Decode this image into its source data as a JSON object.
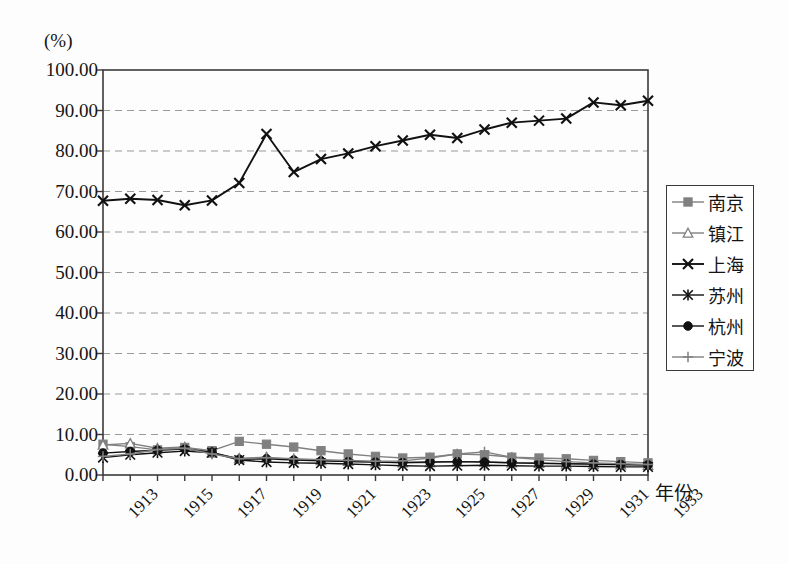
{
  "axis": {
    "unit_label": "(%)",
    "x_title": "年份",
    "y_ticks": [
      "100.00",
      "90.00",
      "80.00",
      "70.00",
      "60.00",
      "50.00",
      "40.00",
      "30.00",
      "20.00",
      "10.00",
      "0.00"
    ],
    "x_ticks": [
      "1913",
      "1915",
      "1917",
      "1919",
      "1921",
      "1923",
      "1925",
      "1927",
      "1929",
      "1931",
      "1933"
    ]
  },
  "legend": {
    "items": [
      {
        "label": "南京",
        "marker": "square"
      },
      {
        "label": "镇江",
        "marker": "triangle"
      },
      {
        "label": "上海",
        "marker": "cross"
      },
      {
        "label": "苏州",
        "marker": "asterisk"
      },
      {
        "label": "杭州",
        "marker": "circle"
      },
      {
        "label": "宁波",
        "marker": "plus"
      }
    ]
  },
  "colors": {
    "line_dark": "#111111",
    "line_gray": "#808080",
    "grid": "#9a9a9a",
    "frame": "#3a3a3a",
    "background": "#fdfdfd"
  },
  "chart_data": {
    "type": "line",
    "title": "",
    "xlabel": "年份",
    "ylabel": "(%)",
    "xlim": [
      1913,
      1933
    ],
    "ylim": [
      0,
      100
    ],
    "ytick_step": 10,
    "grid": true,
    "grid_style": "dashed-horizontal",
    "legend_position": "right",
    "x": [
      1913,
      1914,
      1915,
      1916,
      1917,
      1918,
      1919,
      1920,
      1921,
      1922,
      1923,
      1924,
      1925,
      1926,
      1927,
      1928,
      1929,
      1930,
      1931,
      1932,
      1933
    ],
    "series": [
      {
        "name": "南京",
        "marker": "square",
        "color": "#808080",
        "values": [
          7.6,
          7.0,
          6.2,
          6.8,
          6.0,
          8.3,
          7.6,
          6.9,
          6.0,
          5.2,
          4.6,
          4.2,
          4.4,
          5.2,
          5.0,
          4.4,
          4.2,
          4.0,
          3.6,
          3.3,
          3.0
        ]
      },
      {
        "name": "镇江",
        "marker": "triangle",
        "color": "#808080",
        "values": [
          7.4,
          7.8,
          6.6,
          6.9,
          5.4,
          4.1,
          4.4,
          3.8,
          3.6,
          3.4,
          3.2,
          3.0,
          3.1,
          3.3,
          3.2,
          3.0,
          2.9,
          2.7,
          2.6,
          2.5,
          2.4
        ]
      },
      {
        "name": "上海",
        "marker": "cross",
        "color": "#111111",
        "values": [
          67.7,
          68.2,
          67.9,
          66.6,
          67.8,
          72.1,
          84.2,
          74.8,
          78.0,
          79.4,
          81.2,
          82.6,
          84.0,
          83.2,
          85.3,
          87.0,
          87.5,
          88.0,
          92.0,
          91.3,
          92.4
        ]
      },
      {
        "name": "苏州",
        "marker": "asterisk",
        "color": "#111111",
        "values": [
          4.3,
          5.0,
          5.5,
          5.9,
          5.5,
          3.7,
          3.2,
          3.0,
          2.9,
          2.7,
          2.5,
          2.3,
          2.2,
          2.3,
          2.4,
          2.3,
          2.2,
          2.2,
          2.1,
          2.0,
          2.0
        ]
      },
      {
        "name": "杭州",
        "marker": "circle",
        "color": "#111111",
        "values": [
          5.4,
          5.8,
          6.1,
          6.4,
          5.6,
          3.9,
          4.0,
          3.7,
          3.5,
          3.3,
          3.2,
          3.1,
          3.2,
          3.3,
          3.2,
          3.0,
          2.9,
          2.8,
          2.7,
          2.6,
          2.5
        ]
      },
      {
        "name": "宁波",
        "marker": "plus",
        "color": "#808080",
        "values": [
          4.6,
          5.2,
          6.3,
          6.6,
          5.2,
          4.0,
          4.3,
          4.0,
          3.8,
          3.6,
          3.4,
          3.5,
          4.2,
          5.2,
          5.7,
          4.4,
          3.8,
          3.3,
          3.0,
          2.8,
          2.6
        ]
      }
    ]
  }
}
